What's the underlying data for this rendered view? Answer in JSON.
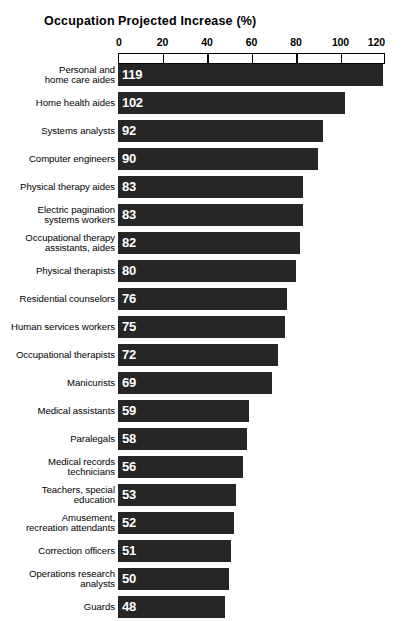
{
  "header": {
    "occupation_label": "Occupation",
    "measure_label": "Projected Increase (%)"
  },
  "chart_data": {
    "type": "bar",
    "orientation": "horizontal",
    "title": "Projected Increase (%)",
    "xlabel": "Projected Increase (%)",
    "ylabel": "Occupation",
    "xlim": [
      0,
      120
    ],
    "ticks": [
      0,
      20,
      40,
      60,
      80,
      100,
      120
    ],
    "tick_labels": [
      "0",
      "20",
      "40",
      "60",
      "80",
      "100",
      "120"
    ],
    "grid": false,
    "legend": null,
    "bar_color": "#262626",
    "value_label_color": "#ffffff",
    "categories": [
      "Personal and home care aides",
      "Home health aides",
      "Systems analysts",
      "Computer engineers",
      "Physical therapy aides",
      "Electric pagination systems workers",
      "Occupational therapy assistants, aides",
      "Physical therapists",
      "Residential counselors",
      "Human services workers",
      "Occupational therapists",
      "Manicurists",
      "Medical assistants",
      "Paralegals",
      "Medical records technicians",
      "Teachers, special education",
      "Amusement, recreation attendants",
      "Correction officers",
      "Operations research analysts",
      "Guards"
    ],
    "category_lines": [
      [
        "Personal and",
        "home care aides"
      ],
      [
        "Home health aides"
      ],
      [
        "Systems analysts"
      ],
      [
        "Computer engineers"
      ],
      [
        "Physical therapy aides"
      ],
      [
        "Electric pagination",
        "systems workers"
      ],
      [
        "Occupational therapy",
        "assistants, aides"
      ],
      [
        "Physical therapists"
      ],
      [
        "Residential counselors"
      ],
      [
        "Human services workers"
      ],
      [
        "Occupational therapists"
      ],
      [
        "Manicurists"
      ],
      [
        "Medical assistants"
      ],
      [
        "Paralegals"
      ],
      [
        "Medical records",
        "technicians"
      ],
      [
        "Teachers, special",
        "education"
      ],
      [
        "Amusement,",
        "recreation attendants"
      ],
      [
        "Correction officers"
      ],
      [
        "Operations research",
        "analysts"
      ],
      [
        "Guards"
      ]
    ],
    "values": [
      119,
      102,
      92,
      90,
      83,
      83,
      82,
      80,
      76,
      75,
      72,
      69,
      59,
      58,
      56,
      53,
      52,
      51,
      50,
      48
    ],
    "value_labels": [
      "119",
      "102",
      "92",
      "90",
      "83",
      "83",
      "82",
      "80",
      "76",
      "75",
      "72",
      "69",
      "59",
      "58",
      "56",
      "53",
      "52",
      "51",
      "50",
      "48"
    ]
  }
}
